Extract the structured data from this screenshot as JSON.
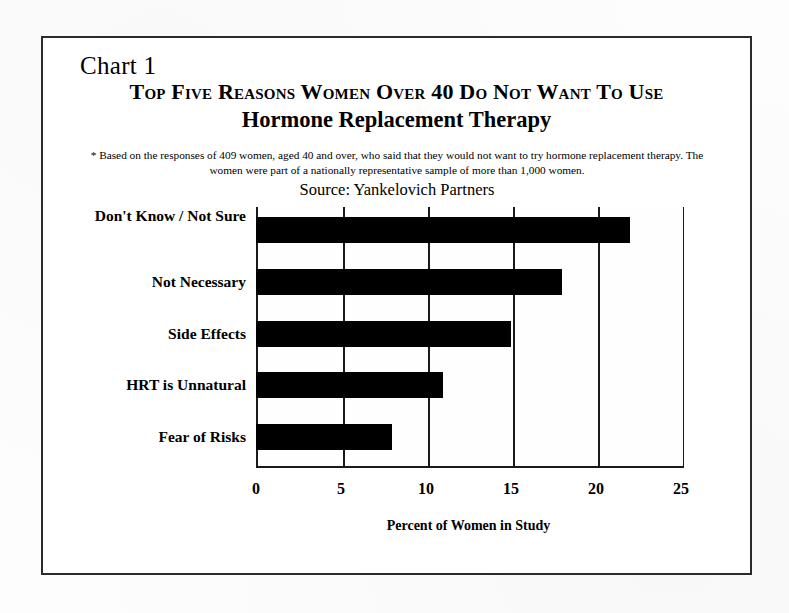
{
  "document": {
    "chart_label": "Chart 1",
    "title_line_1": "Top Five Reasons Women Over 40 Do Not Want To Use",
    "title_line_2": "Hormone Replacement Therapy",
    "footnote": "* Based on the responses of 409 women, aged 40 and over, who said that they would not want to try hormone replacement therapy.  The women were part of a nationally representative sample of more than 1,000 women.",
    "source": "Source:  Yankelovich Partners"
  },
  "chart_data": {
    "type": "bar",
    "orientation": "horizontal",
    "title": "Top Five Reasons Women Over 40 Do Not Want To Use Hormone Replacement Therapy",
    "subtitle": "Source:  Yankelovich Partners",
    "categories": [
      "Don't Know / Not Sure",
      "Not Necessary",
      "Side Effects",
      "HRT is Unnatural",
      "Fear of Risks"
    ],
    "values": [
      22,
      18,
      15,
      11,
      8
    ],
    "xlabel": "Percent of Women in Study",
    "ylabel": "",
    "xlim": [
      0,
      25
    ],
    "xticks": [
      0,
      5,
      10,
      15,
      20,
      25
    ],
    "xtick_labels": [
      "0",
      "5",
      "10",
      "15",
      "20",
      "25"
    ],
    "grid": "vertical",
    "legend": "none",
    "bar_color": "#000000",
    "plot_background": "#FEFEFE",
    "axis_color": "#1A1A1A"
  }
}
